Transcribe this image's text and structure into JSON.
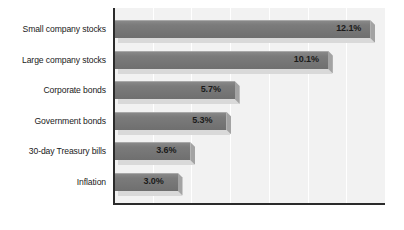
{
  "chart_data": {
    "type": "bar",
    "orientation": "horizontal",
    "title": "",
    "subtitle": "",
    "xlabel": "",
    "ylabel": "",
    "categories": [
      "Small company stocks",
      "Large company stocks",
      "Corporate bonds",
      "Government bonds",
      "30-day Treasury bills",
      "Inflation"
    ],
    "values": [
      12.1,
      10.1,
      5.7,
      5.3,
      3.6,
      3.0
    ],
    "value_labels": [
      "12.1%",
      "10.1%",
      "5.7%",
      "5.3%",
      "3.6%",
      "3.0%"
    ],
    "xlim": [
      0,
      12.8
    ],
    "grid": true,
    "gridline_count": 6,
    "legend": null,
    "annotations": [],
    "colors": {
      "bar_face": "#7c7c7c",
      "bar_highlight": "#a8a8a8",
      "bar_shadow": "#d9d9d9",
      "bar_cap": "#a3a3a3",
      "plot_background": "#f2f2f2",
      "axis_line": "#2b2b2b",
      "gridline": "#ffffff",
      "label_text": "#1a1a1a",
      "page_background": "#ffffff"
    }
  }
}
